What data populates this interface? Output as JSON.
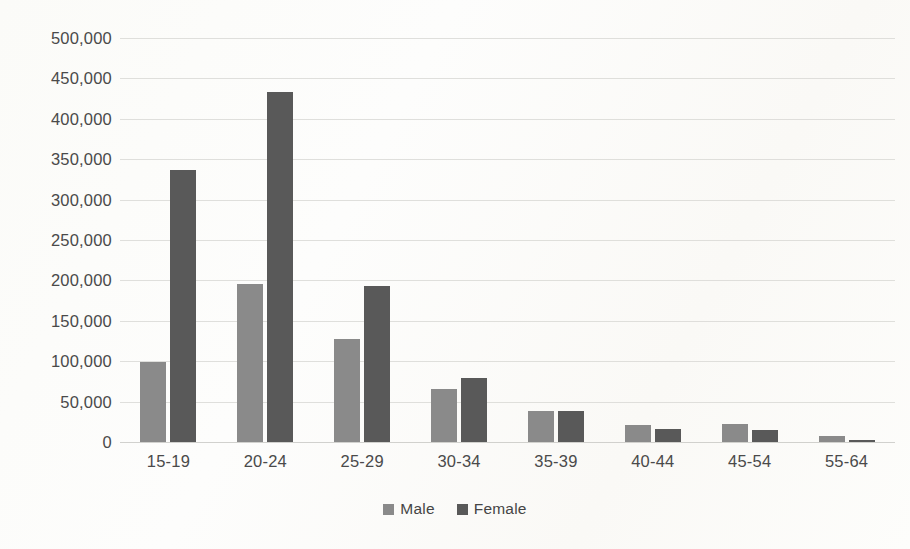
{
  "chart_data": {
    "type": "bar",
    "title": "",
    "subtitle": "",
    "xlabel": "",
    "ylabel": "",
    "categories": [
      "15-19",
      "20-24",
      "25-29",
      "30-34",
      "35-39",
      "40-44",
      "45-54",
      "55-64"
    ],
    "series": [
      {
        "name": "Male",
        "color": "#8a8a8a",
        "values": [
          99000,
          196000,
          127000,
          66000,
          38000,
          21000,
          22000,
          7000
        ]
      },
      {
        "name": "Female",
        "color": "#595959",
        "values": [
          337000,
          433000,
          193000,
          79000,
          38000,
          16000,
          15000,
          3000
        ]
      }
    ],
    "ylim": [
      0,
      500000
    ],
    "ytick_values": [
      0,
      50000,
      100000,
      150000,
      200000,
      250000,
      300000,
      350000,
      400000,
      450000,
      500000
    ],
    "ytick_labels": [
      "0",
      "50,000",
      "100,000",
      "150,000",
      "200,000",
      "250,000",
      "300,000",
      "350,000",
      "400,000",
      "450,000",
      "500,000"
    ],
    "grid": true,
    "grid_axis": "y",
    "legend_position": "bottom",
    "legend": [
      "Male",
      "Female"
    ],
    "background_color": "#fdfdfb",
    "gridline_color": "#d9d9d6",
    "text_color": "#4a4a4a"
  }
}
